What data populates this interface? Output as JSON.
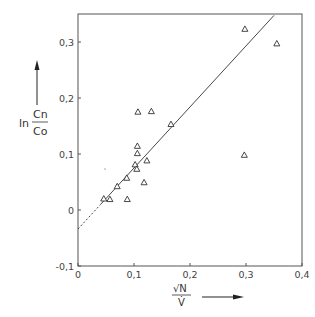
{
  "chart_data": {
    "type": "scatter",
    "title": "",
    "xlabel": "√N / V̇",
    "ylabel": "ln Cn/Co",
    "xlim": [
      0,
      0.4
    ],
    "ylim": [
      -0.1,
      0.35
    ],
    "x_ticks": [
      "0",
      "0,1",
      "0,2",
      "0,3",
      "0,4"
    ],
    "y_ticks": [
      "-0,1",
      "0",
      "0,1",
      "0,2",
      "0,3"
    ],
    "grid": false,
    "legend": null,
    "marker": "triangle-open",
    "series": [
      {
        "name": "measurements",
        "points": [
          {
            "x": 0.046,
            "y": 0.02
          },
          {
            "x": 0.057,
            "y": 0.019
          },
          {
            "x": 0.07,
            "y": 0.042
          },
          {
            "x": 0.087,
            "y": 0.057
          },
          {
            "x": 0.088,
            "y": 0.019
          },
          {
            "x": 0.102,
            "y": 0.081
          },
          {
            "x": 0.105,
            "y": 0.073
          },
          {
            "x": 0.106,
            "y": 0.101
          },
          {
            "x": 0.106,
            "y": 0.114
          },
          {
            "x": 0.107,
            "y": 0.175
          },
          {
            "x": 0.118,
            "y": 0.049
          },
          {
            "x": 0.123,
            "y": 0.088
          },
          {
            "x": 0.131,
            "y": 0.176
          },
          {
            "x": 0.166,
            "y": 0.153
          },
          {
            "x": 0.297,
            "y": 0.098
          },
          {
            "x": 0.298,
            "y": 0.323
          },
          {
            "x": 0.355,
            "y": 0.297
          }
        ]
      }
    ],
    "fit_line": {
      "intercept": -0.034,
      "slope": 1.09,
      "dashed_x_range": [
        0,
        0.04
      ],
      "solid_x_range": [
        0.04,
        0.35
      ]
    }
  },
  "labels": {
    "y_ln": "ln",
    "y_num": "Cn",
    "y_den": "Co",
    "x_num": "√N",
    "x_den": "V̇"
  }
}
